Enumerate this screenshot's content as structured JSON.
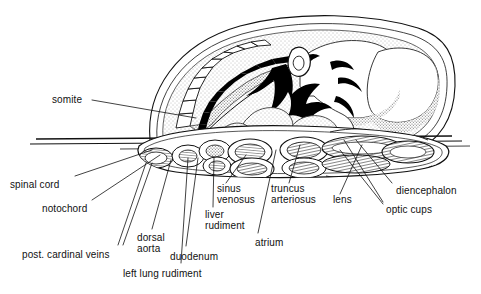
{
  "figure": {
    "background_color": "#ffffff",
    "ink_color": "#111111",
    "stipple_color": "#5a5a5a"
  },
  "labels": [
    {
      "id": "somite",
      "text": "somite",
      "x": 52,
      "y": 99,
      "align": "left"
    },
    {
      "id": "spinal-cord",
      "text": "spinal cord",
      "x": 10,
      "y": 179,
      "align": "left"
    },
    {
      "id": "notochord",
      "text": "notochord",
      "x": 42,
      "y": 203,
      "align": "left"
    },
    {
      "id": "post-cardinal-veins",
      "text": "post. cardinal veins",
      "x": 22,
      "y": 249,
      "align": "left"
    },
    {
      "id": "dorsal-aorta",
      "text": "dorsal\naorta",
      "x": 137,
      "y": 237,
      "align": "left"
    },
    {
      "id": "left-lung-rudiment",
      "text": "left lung rudiment",
      "x": 123,
      "y": 270,
      "align": "left"
    },
    {
      "id": "duodenum",
      "text": "duodenum",
      "x": 170,
      "y": 253,
      "align": "left"
    },
    {
      "id": "liver-rudiment",
      "text": "liver\nrudiment",
      "x": 205,
      "y": 214,
      "align": "left"
    },
    {
      "id": "sinus-venosus",
      "text": "sinus\nvenosus",
      "x": 217,
      "y": 188,
      "align": "left"
    },
    {
      "id": "atrium",
      "text": "atrium",
      "x": 255,
      "y": 238,
      "align": "left"
    },
    {
      "id": "truncus-arteriosus",
      "text": "truncus\narteriosus",
      "x": 271,
      "y": 188,
      "align": "left"
    },
    {
      "id": "lens",
      "text": "lens",
      "x": 333,
      "y": 199,
      "align": "left"
    },
    {
      "id": "diencephalon",
      "text": "diencephalon",
      "x": 396,
      "y": 186,
      "align": "left"
    },
    {
      "id": "optic-cups",
      "text": "optic cups",
      "x": 386,
      "y": 206,
      "align": "left"
    }
  ],
  "leader_lines": [
    {
      "id": "somite",
      "from": [
        92,
        100
      ],
      "to": [
        196,
        118
      ]
    },
    {
      "id": "spinal-cord",
      "from": [
        75,
        176
      ],
      "to": [
        152,
        150
      ]
    },
    {
      "id": "notochord",
      "from": [
        92,
        200
      ],
      "to": [
        160,
        155
      ]
    },
    {
      "id": "post-cardinal-veins",
      "from": [
        118,
        245
      ],
      "to": [
        146,
        163
      ]
    },
    {
      "id": "post-cardinal-veins2",
      "from": [
        122,
        245
      ],
      "to": [
        152,
        163
      ]
    },
    {
      "id": "dorsal-aorta",
      "from": [
        152,
        229
      ],
      "to": [
        171,
        160
      ]
    },
    {
      "id": "left-lung-rudiment",
      "from": [
        181,
        263
      ],
      "to": [
        188,
        158
      ]
    },
    {
      "id": "duodenum",
      "from": [
        186,
        246
      ],
      "to": [
        198,
        158
      ]
    },
    {
      "id": "liver-rudiment",
      "from": [
        213,
        207
      ],
      "to": [
        214,
        158
      ]
    },
    {
      "id": "sinus-venosus",
      "from": [
        226,
        183
      ],
      "to": [
        246,
        155
      ]
    },
    {
      "id": "atrium",
      "from": [
        258,
        233
      ],
      "to": [
        276,
        150
      ]
    },
    {
      "id": "truncus-arteriosus",
      "from": [
        289,
        183
      ],
      "to": [
        300,
        145
      ]
    },
    {
      "id": "lens",
      "from": [
        340,
        194
      ],
      "to": [
        362,
        145
      ]
    },
    {
      "id": "diencephalon",
      "from": [
        392,
        183
      ],
      "to": [
        356,
        140
      ]
    },
    {
      "id": "optic-cups",
      "from": [
        383,
        202
      ],
      "to": [
        344,
        140
      ]
    },
    {
      "id": "optic-cups2",
      "from": [
        383,
        204
      ],
      "to": [
        340,
        150
      ]
    }
  ]
}
